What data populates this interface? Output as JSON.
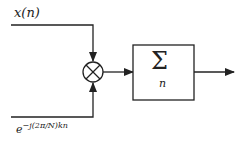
{
  "diagram": {
    "input_signal_label": "x(n)",
    "kernel_label_base": "e",
    "kernel_label_exponent": "−j(2π/N)kn",
    "multiplier_symbol": "⊗",
    "summation_symbol": "Σ",
    "summation_subscript": "n",
    "colors": {
      "line": "#222222",
      "background": "#ffffff"
    }
  }
}
